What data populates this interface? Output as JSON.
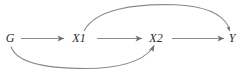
{
  "diagram": {
    "type": "causal-dag",
    "background_color": "#ffffff",
    "edge_color": "#8a8a8a",
    "arrowhead_color": "#6e6e6e",
    "label_color": "#2b2b2b",
    "nodes": [
      {
        "id": "G",
        "label": "G",
        "x": 10,
        "y": 42
      },
      {
        "id": "X1",
        "label": "X1",
        "x": 79,
        "y": 42
      },
      {
        "id": "X2",
        "label": "X2",
        "x": 156,
        "y": 42
      },
      {
        "id": "Y",
        "label": "Y",
        "x": 232,
        "y": 42
      }
    ],
    "edges": [
      {
        "id": "g-to-x1",
        "from": "G",
        "to": "X1",
        "shape": "straight"
      },
      {
        "id": "x1-to-x2",
        "from": "X1",
        "to": "X2",
        "shape": "straight"
      },
      {
        "id": "x2-to-y",
        "from": "X2",
        "to": "Y",
        "shape": "straight"
      },
      {
        "id": "x1-to-y",
        "from": "X1",
        "to": "Y",
        "shape": "curved-above"
      },
      {
        "id": "g-to-x2",
        "from": "G",
        "to": "X2",
        "shape": "curved-below"
      }
    ]
  }
}
